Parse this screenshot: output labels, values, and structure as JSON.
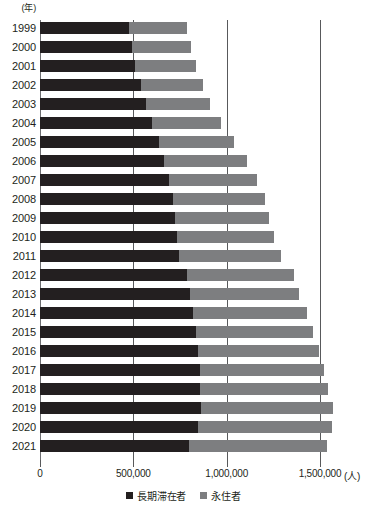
{
  "chart_data": {
    "type": "bar",
    "orientation": "horizontal",
    "stacked": true,
    "title": "",
    "xlabel": "(人)",
    "ylabel": "(年)",
    "xlim": [
      0,
      1500000
    ],
    "xticks": [
      0,
      500000,
      1000000,
      1500000
    ],
    "xtick_labels": [
      "0",
      "500,000",
      "1,000,000",
      "1,500,000"
    ],
    "grid": true,
    "legend_position": "bottom",
    "categories": [
      "1999",
      "2000",
      "2001",
      "2002",
      "2003",
      "2004",
      "2005",
      "2006",
      "2007",
      "2008",
      "2009",
      "2010",
      "2011",
      "2012",
      "2013",
      "2014",
      "2015",
      "2016",
      "2017",
      "2018",
      "2019",
      "2020",
      "2021"
    ],
    "series": [
      {
        "name": "長期滞在者",
        "color": "#231f20",
        "values": [
          478000,
          493000,
          510000,
          541000,
          568000,
          600000,
          635000,
          665000,
          693000,
          711000,
          722000,
          733000,
          742000,
          790000,
          801000,
          820000,
          838000,
          848000,
          855000,
          857000,
          862000,
          845000,
          800000
        ]
      },
      {
        "name": "永住者",
        "color": "#7d7e80",
        "values": [
          312000,
          318000,
          325000,
          332000,
          341000,
          369000,
          406000,
          443000,
          472000,
          492000,
          507000,
          523000,
          547000,
          569000,
          588000,
          608000,
          627000,
          646000,
          665000,
          686000,
          705000,
          720000,
          740000
        ]
      }
    ],
    "totals": [
      790000,
      811000,
      835000,
      873000,
      909000,
      969000,
      1041000,
      1108000,
      1165000,
      1203000,
      1229000,
      1256000,
      1289000,
      1359000,
      1389000,
      1428000,
      1465000,
      1494000,
      1520000,
      1543000,
      1567000,
      1565000,
      1540000
    ]
  },
  "axis": {
    "y_unit_label": "(年)",
    "x_unit_label": "(人)"
  },
  "legend": {
    "items": [
      {
        "label": "長期滞在者",
        "color": "#231f20"
      },
      {
        "label": "永住者",
        "color": "#7d7e80"
      }
    ]
  },
  "colors": {
    "series_a": "#231f20",
    "series_b": "#7d7e80",
    "gridline": "#58595b",
    "text": "#231f20",
    "background": "#ffffff"
  }
}
